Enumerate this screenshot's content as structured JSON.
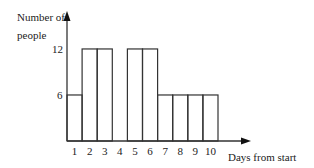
{
  "chart_data": {
    "type": "bar",
    "title": "",
    "ylabel": "Number of people",
    "xlabel": "Days from start",
    "categories": [
      "1",
      "2",
      "3",
      "4",
      "5",
      "6",
      "7",
      "8",
      "9",
      "10"
    ],
    "values": [
      6,
      12,
      12,
      0,
      12,
      12,
      6,
      6,
      6,
      6
    ],
    "yticks": [
      "6",
      "12"
    ],
    "ylim": [
      0,
      14
    ],
    "grid": false,
    "legend": null
  },
  "labels": {
    "ylabel_line1": "Number of",
    "ylabel_line2": "people",
    "xlabel": "Days from start",
    "ytick_6": "6",
    "ytick_12": "12"
  }
}
